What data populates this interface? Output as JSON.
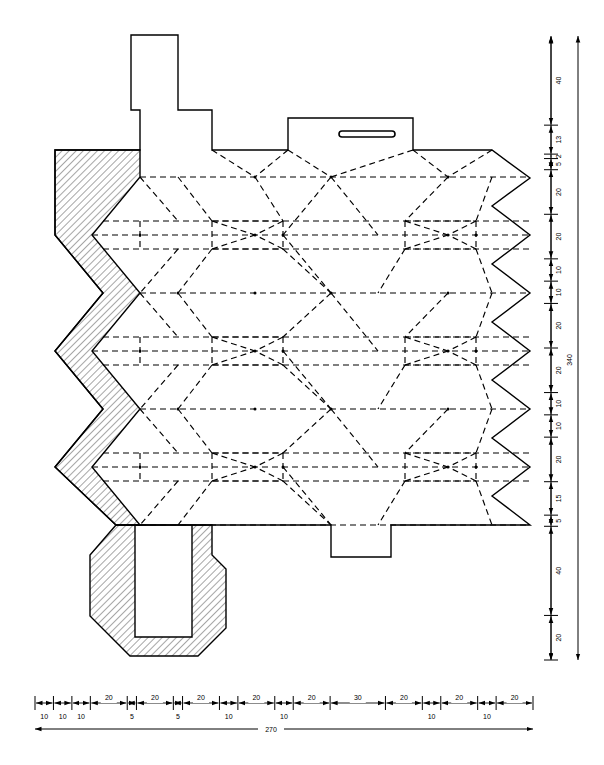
{
  "drawing": {
    "title": "Flat pattern layout - hexagonal fold development",
    "type": "engineering-flat-pattern",
    "units": "mm",
    "line_color": "#000000",
    "background_color": "#ffffff",
    "fold_line_style": "dashed",
    "cut_line_style": "solid",
    "hatch_color": "#000000"
  },
  "horizontal_dimension_chain": {
    "name": "bottom-dimension-chain",
    "overall_label": "270",
    "segments": [
      {
        "label": "10",
        "value": 10,
        "row": "lower"
      },
      {
        "label": "10",
        "value": 10,
        "row": "lower"
      },
      {
        "label": "10",
        "value": 10,
        "row": "lower"
      },
      {
        "label": "20",
        "value": 20,
        "row": "upper"
      },
      {
        "label": "5",
        "value": 5,
        "row": "lower"
      },
      {
        "label": "20",
        "value": 20,
        "row": "upper"
      },
      {
        "label": "5",
        "value": 5,
        "row": "lower"
      },
      {
        "label": "20",
        "value": 20,
        "row": "upper"
      },
      {
        "label": "10",
        "value": 10,
        "row": "lower"
      },
      {
        "label": "20",
        "value": 20,
        "row": "upper"
      },
      {
        "label": "10",
        "value": 10,
        "row": "lower"
      },
      {
        "label": "20",
        "value": 20,
        "row": "upper"
      },
      {
        "label": "30",
        "value": 30,
        "row": "upper"
      },
      {
        "label": "20",
        "value": 20,
        "row": "upper"
      },
      {
        "label": "10",
        "value": 10,
        "row": "lower"
      },
      {
        "label": "20",
        "value": 20,
        "row": "upper"
      },
      {
        "label": "10",
        "value": 10,
        "row": "lower"
      },
      {
        "label": "20",
        "value": 20,
        "row": "upper"
      }
    ]
  },
  "vertical_dimension_chain": {
    "name": "right-dimension-chain",
    "overall_label": "340",
    "segments": [
      {
        "label": "40",
        "value": 40
      },
      {
        "label": "13",
        "value": 13
      },
      {
        "label": "2",
        "value": 2
      },
      {
        "label": "5",
        "value": 5
      },
      {
        "label": "20",
        "value": 20
      },
      {
        "label": "20",
        "value": 20
      },
      {
        "label": "10",
        "value": 10
      },
      {
        "label": "10",
        "value": 10
      },
      {
        "label": "20",
        "value": 20
      },
      {
        "label": "20",
        "value": 20
      },
      {
        "label": "10",
        "value": 10
      },
      {
        "label": "10",
        "value": 10
      },
      {
        "label": "20",
        "value": 20
      },
      {
        "label": "15",
        "value": 15
      },
      {
        "label": "5",
        "value": 5
      },
      {
        "label": "40",
        "value": 40
      },
      {
        "label": "20",
        "value": 20
      }
    ]
  },
  "features": {
    "top_left_tab_label": "top-left-tab",
    "top_right_tab_label": "top-right-tab",
    "slot_label": "slot-cutout",
    "bottom_tab_label": "bottom-tab",
    "bottom_octagon_label": "bottom-octagon-flap",
    "left_zigzag_label": "left-zigzag-hatched-band",
    "right_zigzag_label": "right-zigzag-edge"
  }
}
